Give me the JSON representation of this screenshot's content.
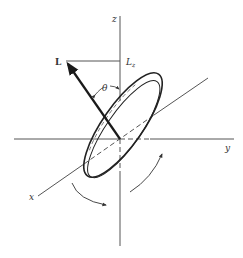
{
  "diagram": {
    "labels": {
      "z_axis": "z",
      "y_axis": "y",
      "x_axis": "x",
      "vector": "L",
      "projection_main": "L",
      "projection_sub": "z",
      "angle": "θ"
    },
    "colors": {
      "line": "#555555",
      "vector": "#1a1a1a",
      "disk": "#222222",
      "background": "#ffffff"
    }
  }
}
